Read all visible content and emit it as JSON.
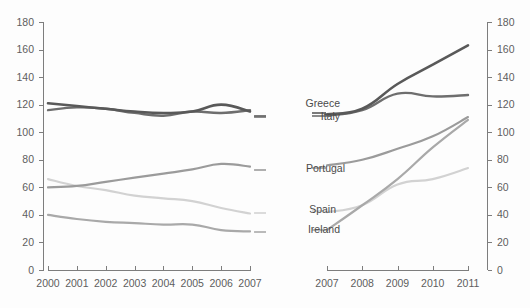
{
  "chart_data": {
    "type": "line",
    "title": "",
    "subtitle": "",
    "xlabel": "",
    "ylabel": "",
    "ylim": [
      0,
      180
    ],
    "yticks": [
      0,
      20,
      40,
      60,
      80,
      100,
      120,
      140,
      160,
      180
    ],
    "grid": false,
    "legend_position": "inline-center",
    "panels": [
      {
        "name": "left-panel",
        "x": [
          2000,
          2001,
          2002,
          2003,
          2004,
          2005,
          2006,
          2007
        ],
        "xticklabels": [
          "2000",
          "2001",
          "2002",
          "2003",
          "2004",
          "2005",
          "2006",
          "2007"
        ],
        "series": [
          {
            "name": "Greece",
            "color": "#595959",
            "values": [
              121,
              119,
              117,
              115,
              114,
              115,
              120,
              115
            ]
          },
          {
            "name": "Italy",
            "color": "#6e6e6e",
            "values": [
              116,
              118,
              117,
              114,
              112,
              115,
              114,
              116
            ]
          },
          {
            "name": "Portugal",
            "color": "#9b9b9b",
            "values": [
              60,
              61,
              64,
              67,
              70,
              73,
              77,
              75
            ]
          },
          {
            "name": "Spain",
            "color": "#d2d2d2",
            "values": [
              66,
              61,
              58,
              54,
              52,
              50,
              45,
              41
            ]
          },
          {
            "name": "Ireland",
            "color": "#a9a9a9",
            "values": [
              40,
              37,
              35,
              34,
              33,
              33,
              29,
              28
            ]
          }
        ]
      },
      {
        "name": "right-panel",
        "x": [
          2007,
          2008,
          2009,
          2010,
          2011
        ],
        "xticklabels": [
          "2007",
          "2008",
          "2009",
          "2010",
          "2011"
        ],
        "series": [
          {
            "name": "Greece",
            "color": "#595959",
            "values": [
              113,
              117,
              135,
              149,
              163
            ]
          },
          {
            "name": "Italy",
            "color": "#6e6e6e",
            "values": [
              112,
              116,
              128,
              126,
              127
            ]
          },
          {
            "name": "Portugal",
            "color": "#9b9b9b",
            "values": [
              76,
              80,
              88,
              97,
              111
            ]
          },
          {
            "name": "Spain",
            "color": "#d2d2d2",
            "values": [
              42,
              47,
              62,
              66,
              74
            ]
          },
          {
            "name": "Ireland",
            "color": "#a9a9a9",
            "values": [
              29,
              47,
              66,
              89,
              109
            ]
          }
        ]
      }
    ],
    "series_labels": [
      {
        "name": "Greece",
        "label": "Greece"
      },
      {
        "name": "Italy",
        "label": "Italy"
      },
      {
        "name": "Portugal",
        "label": "Portugal"
      },
      {
        "name": "Spain",
        "label": "Spain"
      },
      {
        "name": "Ireland",
        "label": "Ireland"
      }
    ],
    "colors": {
      "greece": "#595959",
      "italy": "#6e6e6e",
      "portugal": "#9b9b9b",
      "spain": "#d2d2d2",
      "ireland": "#a9a9a9",
      "axis": "#7d7d7d",
      "text": "#5e5e5e",
      "background": "#fdfdfd"
    }
  },
  "axes": {
    "left": {
      "labels": [
        "0",
        "20",
        "40",
        "60",
        "80",
        "100",
        "120",
        "140",
        "160",
        "180"
      ]
    },
    "right": {
      "labels": [
        "0",
        "20",
        "40",
        "60",
        "80",
        "100",
        "120",
        "140",
        "160",
        "180"
      ]
    },
    "x_left": {
      "labels": [
        "2000",
        "2001",
        "2002",
        "2003",
        "2004",
        "2005",
        "2006",
        "2007"
      ]
    },
    "x_right": {
      "labels": [
        "2007",
        "2008",
        "2009",
        "2010",
        "2011"
      ]
    }
  }
}
